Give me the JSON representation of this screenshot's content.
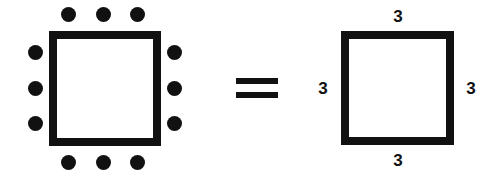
{
  "figure": {
    "relation_symbol": "=",
    "ink_color": "#111111",
    "background_color": "#ffffff",
    "left_figure": {
      "name": "square-with-dots",
      "dots_per_side": 3,
      "total_dots": 12,
      "sides": {
        "top": {
          "count": 3,
          "dots": [
            {
              "x": 61,
              "y": 7
            },
            {
              "x": 96,
              "y": 7
            },
            {
              "x": 130,
              "y": 7
            }
          ]
        },
        "bottom": {
          "count": 3,
          "dots": [
            {
              "x": 61,
              "y": 155
            },
            {
              "x": 96,
              "y": 155
            },
            {
              "x": 130,
              "y": 155
            }
          ]
        },
        "left": {
          "count": 3,
          "dots": [
            {
              "x": 28,
              "y": 45
            },
            {
              "x": 28,
              "y": 81
            },
            {
              "x": 28,
              "y": 116
            }
          ]
        },
        "right": {
          "count": 3,
          "dots": [
            {
              "x": 167,
              "y": 45
            },
            {
              "x": 167,
              "y": 81
            },
            {
              "x": 167,
              "y": 116
            }
          ]
        }
      }
    },
    "right_figure": {
      "name": "square-with-side-labels",
      "labels": {
        "top": "3",
        "right": "3",
        "bottom": "3",
        "left": "3"
      }
    }
  }
}
